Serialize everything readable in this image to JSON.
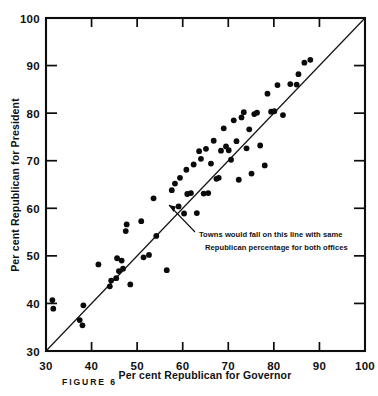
{
  "figure": {
    "caption": "FIGURE 6",
    "x_axis_title": "Per cent Republican for Governor",
    "y_axis_title": "Per cent Republican for President",
    "annotation_line1": "Towns would fall on this line with same",
    "annotation_line2": "Republican percentage for both offices",
    "ink_color": "#0d0d0d",
    "background_color": "#ffffff"
  },
  "chart_data": {
    "type": "scatter",
    "title": "FIGURE 6",
    "xlabel": "Per cent Republican for Governor",
    "ylabel": "Per cent Republican for President",
    "xlim": [
      30,
      100
    ],
    "ylim": [
      30,
      100
    ],
    "xticks": [
      30,
      40,
      50,
      60,
      70,
      80,
      90,
      100
    ],
    "yticks": [
      30,
      40,
      50,
      60,
      70,
      80,
      90,
      100
    ],
    "xtick_labels": [
      "30",
      "40",
      "50",
      "60",
      "70",
      "80",
      "90",
      "100"
    ],
    "ytick_labels": [
      "30",
      "40",
      "50",
      "60",
      "70",
      "80",
      "90",
      "100"
    ],
    "grid": false,
    "legend": null,
    "annotations": [
      {
        "text": "Towns would fall on this line with same Republican percentage for both offices",
        "points_to": [
          56,
          52.5
        ],
        "text_x": 64,
        "text_y": 49
      }
    ],
    "reference_line": {
      "name": "identity-line",
      "equation": "y = x",
      "from": [
        30,
        30
      ],
      "to": [
        100,
        100
      ]
    },
    "series": [
      {
        "name": "Towns",
        "marker": "filled-circle",
        "color": "#0a0a0a",
        "points": [
          [
            31.4,
            40.7
          ],
          [
            31.6,
            38.9
          ],
          [
            37.4,
            36.5
          ],
          [
            38.0,
            35.4
          ],
          [
            38.2,
            39.6
          ],
          [
            41.5,
            48.2
          ],
          [
            44.0,
            43.6
          ],
          [
            44.3,
            44.8
          ],
          [
            45.4,
            45.3
          ],
          [
            45.6,
            49.5
          ],
          [
            46.6,
            49.0
          ],
          [
            46.0,
            46.8
          ],
          [
            46.9,
            47.3
          ],
          [
            47.5,
            55.2
          ],
          [
            47.7,
            56.6
          ],
          [
            48.5,
            44.0
          ],
          [
            50.9,
            57.3
          ],
          [
            51.4,
            49.7
          ],
          [
            52.6,
            50.2
          ],
          [
            53.6,
            62.1
          ],
          [
            54.2,
            54.2
          ],
          [
            56.5,
            47.0
          ],
          [
            57.6,
            63.8
          ],
          [
            58.3,
            65.2
          ],
          [
            59.1,
            60.4
          ],
          [
            59.4,
            66.4
          ],
          [
            60.3,
            58.9
          ],
          [
            60.8,
            68.1
          ],
          [
            61.0,
            63.0
          ],
          [
            61.8,
            63.2
          ],
          [
            62.4,
            69.2
          ],
          [
            63.1,
            59.0
          ],
          [
            63.6,
            72.0
          ],
          [
            64.0,
            70.4
          ],
          [
            64.6,
            63.1
          ],
          [
            65.1,
            72.5
          ],
          [
            65.6,
            63.2
          ],
          [
            66.2,
            69.4
          ],
          [
            66.8,
            74.2
          ],
          [
            67.4,
            66.2
          ],
          [
            67.9,
            66.4
          ],
          [
            68.4,
            72.1
          ],
          [
            69.0,
            76.8
          ],
          [
            69.5,
            73.0
          ],
          [
            70.1,
            72.2
          ],
          [
            70.6,
            70.2
          ],
          [
            71.2,
            78.5
          ],
          [
            71.8,
            74.1
          ],
          [
            72.3,
            66.0
          ],
          [
            72.9,
            79.1
          ],
          [
            73.4,
            80.2
          ],
          [
            74.0,
            72.6
          ],
          [
            74.6,
            76.6
          ],
          [
            75.1,
            67.3
          ],
          [
            75.7,
            79.8
          ],
          [
            76.3,
            80.1
          ],
          [
            77.0,
            73.2
          ],
          [
            78.0,
            69.0
          ],
          [
            78.6,
            84.1
          ],
          [
            79.4,
            80.3
          ],
          [
            80.1,
            80.4
          ],
          [
            80.8,
            85.9
          ],
          [
            82.0,
            79.6
          ],
          [
            83.6,
            86.1
          ],
          [
            85.0,
            86.0
          ],
          [
            85.4,
            88.2
          ],
          [
            86.7,
            90.6
          ],
          [
            88.0,
            91.2
          ]
        ]
      }
    ]
  }
}
